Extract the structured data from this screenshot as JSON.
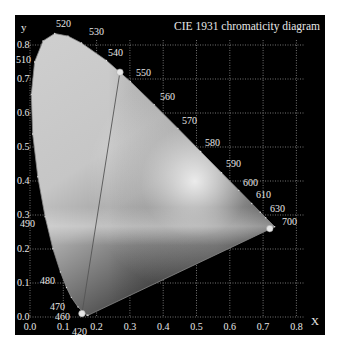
{
  "chart_data": {
    "type": "scatter",
    "title": "CIE 1931 chromaticity diagram",
    "xlabel": "X",
    "ylabel": "y",
    "xlim": [
      0.0,
      0.85
    ],
    "ylim": [
      0.0,
      0.85
    ],
    "grid": true,
    "x_ticks": [
      "0.0",
      "0.1",
      "0.2",
      "0.3",
      "0.4",
      "0.5",
      "0.6",
      "0.7",
      "0.8"
    ],
    "y_ticks": [
      "0.0",
      "0.1",
      "0.2",
      "0.3",
      "0.4",
      "0.5",
      "0.6",
      "0.7",
      "0.8"
    ],
    "spectral_locus": {
      "name": "Spectral locus (nm)",
      "points": [
        {
          "nm": 380,
          "x": 0.1741,
          "y": 0.005
        },
        {
          "nm": 420,
          "x": 0.1714,
          "y": 0.0051
        },
        {
          "nm": 450,
          "x": 0.1566,
          "y": 0.0177
        },
        {
          "nm": 460,
          "x": 0.144,
          "y": 0.0297
        },
        {
          "nm": 470,
          "x": 0.1241,
          "y": 0.0578
        },
        {
          "nm": 475,
          "x": 0.1096,
          "y": 0.0868
        },
        {
          "nm": 480,
          "x": 0.0913,
          "y": 0.1327
        },
        {
          "nm": 485,
          "x": 0.0687,
          "y": 0.2007
        },
        {
          "nm": 490,
          "x": 0.0454,
          "y": 0.295
        },
        {
          "nm": 495,
          "x": 0.0235,
          "y": 0.4127
        },
        {
          "nm": 500,
          "x": 0.0082,
          "y": 0.5384
        },
        {
          "nm": 505,
          "x": 0.0039,
          "y": 0.6548
        },
        {
          "nm": 510,
          "x": 0.0139,
          "y": 0.7502
        },
        {
          "nm": 515,
          "x": 0.0389,
          "y": 0.812
        },
        {
          "nm": 520,
          "x": 0.0743,
          "y": 0.8338
        },
        {
          "nm": 525,
          "x": 0.1142,
          "y": 0.8262
        },
        {
          "nm": 530,
          "x": 0.1547,
          "y": 0.8059
        },
        {
          "nm": 540,
          "x": 0.2296,
          "y": 0.7543
        },
        {
          "nm": 550,
          "x": 0.3016,
          "y": 0.6923
        },
        {
          "nm": 560,
          "x": 0.3731,
          "y": 0.6245
        },
        {
          "nm": 570,
          "x": 0.4441,
          "y": 0.5547
        },
        {
          "nm": 580,
          "x": 0.5125,
          "y": 0.4866
        },
        {
          "nm": 590,
          "x": 0.5752,
          "y": 0.4242
        },
        {
          "nm": 600,
          "x": 0.627,
          "y": 0.3725
        },
        {
          "nm": 610,
          "x": 0.6658,
          "y": 0.334
        },
        {
          "nm": 620,
          "x": 0.6915,
          "y": 0.3083
        },
        {
          "nm": 630,
          "x": 0.7079,
          "y": 0.292
        },
        {
          "nm": 700,
          "x": 0.7347,
          "y": 0.2653
        }
      ]
    },
    "wavelength_labels": [
      {
        "label": "520",
        "px": 56,
        "py": 27,
        "tx": 62,
        "ty": 37
      },
      {
        "label": "530",
        "px": 89,
        "py": 35,
        "tx": 84,
        "ty": 42
      },
      {
        "label": "540",
        "px": 108,
        "py": 56,
        "tx": 105,
        "ty": 61
      },
      {
        "label": "550",
        "px": 136,
        "py": 76,
        "tx": 131,
        "ty": 80
      },
      {
        "label": "560",
        "px": 160,
        "py": 100,
        "tx": 155,
        "ty": 104
      },
      {
        "label": "570",
        "px": 182,
        "py": 124,
        "tx": 178,
        "ty": 128
      },
      {
        "label": "580",
        "px": 205,
        "py": 146,
        "tx": 201,
        "ty": 150
      },
      {
        "label": "590",
        "px": 226,
        "py": 167,
        "tx": 222,
        "ty": 171
      },
      {
        "label": "600",
        "px": 243,
        "py": 186,
        "tx": 239,
        "ty": 189
      },
      {
        "label": "610",
        "px": 256,
        "py": 198,
        "tx": 252,
        "ty": 202
      },
      {
        "label": "630",
        "px": 270,
        "py": 212,
        "tx": 266,
        "ty": 216
      },
      {
        "label": "700",
        "px": 282,
        "py": 225,
        "tx": 277,
        "ty": 228
      },
      {
        "label": "510",
        "px": 16,
        "py": 63,
        "tx": 28,
        "ty": 61
      },
      {
        "label": "490",
        "px": 20,
        "py": 227,
        "tx": 40,
        "ty": 217
      },
      {
        "label": "480",
        "px": 40,
        "py": 284,
        "tx": 57,
        "ty": 280
      },
      {
        "label": "470",
        "px": 50,
        "py": 310,
        "tx": 66,
        "ty": 304
      },
      {
        "label": "460",
        "px": 55,
        "py": 320,
        "tx": 72,
        "ty": 312
      },
      {
        "label": "420",
        "px": 72,
        "py": 335,
        "tx": 85,
        "ty": 319
      }
    ],
    "series": [
      {
        "name": "Gamut primaries",
        "points": [
          {
            "name": "green",
            "x": 0.27,
            "y": 0.72
          },
          {
            "name": "red",
            "x": 0.72,
            "y": 0.26
          },
          {
            "name": "blue",
            "x": 0.156,
            "y": 0.01
          }
        ]
      }
    ],
    "gamut_line": {
      "from": "green",
      "to": "blue"
    }
  },
  "colors": {
    "panel_bg": "#000000",
    "grid": "#bfbfbf",
    "text": "#e8e8e8",
    "locus_fill_light": "#d4d4d4",
    "locus_fill_dark": "#4a4a4a",
    "dot": "#e6e6e6"
  }
}
